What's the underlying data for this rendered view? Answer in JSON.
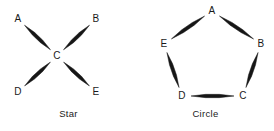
{
  "figure": {
    "background_color": "#ffffff",
    "ink_color": "#161616",
    "width": 274,
    "height": 131
  },
  "diagrams": [
    {
      "id": "star",
      "caption": "Star",
      "topology": "star",
      "nodes": [
        {
          "id": "A",
          "label": "A",
          "x": 18,
          "y": 19
        },
        {
          "id": "B",
          "label": "B",
          "x": 96,
          "y": 19
        },
        {
          "id": "C",
          "label": "C",
          "x": 57,
          "y": 56
        },
        {
          "id": "D",
          "label": "D",
          "x": 18,
          "y": 92
        },
        {
          "id": "E",
          "label": "E",
          "x": 96,
          "y": 92
        }
      ],
      "edges": [
        {
          "from": "A",
          "to": "C",
          "arrow": "double"
        },
        {
          "from": "B",
          "to": "C",
          "arrow": "double"
        },
        {
          "from": "D",
          "to": "C",
          "arrow": "double"
        },
        {
          "from": "E",
          "to": "C",
          "arrow": "double"
        }
      ]
    },
    {
      "id": "circle",
      "caption": "Circle",
      "topology": "ring",
      "nodes": [
        {
          "id": "A",
          "label": "A",
          "x": 75,
          "y": 11
        },
        {
          "id": "B",
          "label": "B",
          "x": 124,
          "y": 44
        },
        {
          "id": "C",
          "label": "C",
          "x": 106,
          "y": 96
        },
        {
          "id": "D",
          "label": "D",
          "x": 45,
          "y": 96
        },
        {
          "id": "E",
          "label": "E",
          "x": 27,
          "y": 44
        }
      ],
      "edges": [
        {
          "from": "A",
          "to": "B",
          "arrow": "double"
        },
        {
          "from": "B",
          "to": "C",
          "arrow": "double"
        },
        {
          "from": "C",
          "to": "D",
          "arrow": "double"
        },
        {
          "from": "D",
          "to": "E",
          "arrow": "double"
        },
        {
          "from": "E",
          "to": "A",
          "arrow": "double"
        }
      ]
    }
  ]
}
